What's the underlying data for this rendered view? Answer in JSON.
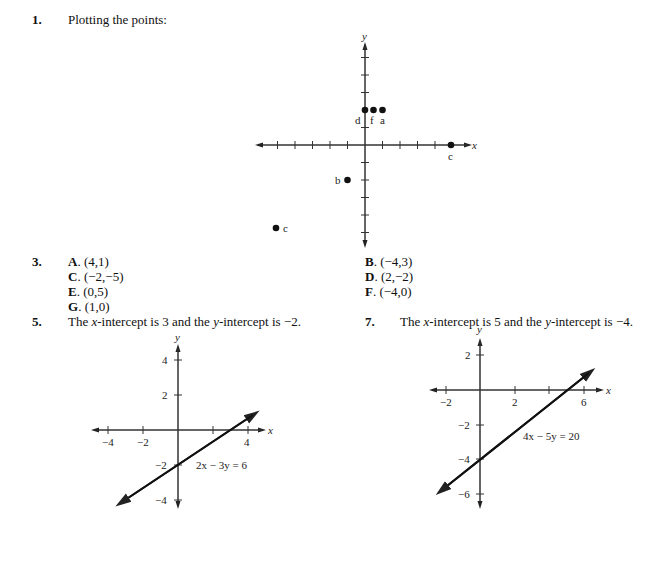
{
  "problem1": {
    "number": "1.",
    "text": "Plotting the points:",
    "graph": {
      "x_axis_label": "x",
      "y_axis_label": "y",
      "points": [
        {
          "label": "d",
          "x": 0,
          "y": 2
        },
        {
          "label": "f",
          "x": 0.5,
          "y": 2
        },
        {
          "label": "a",
          "x": 1,
          "y": 2
        },
        {
          "label": "c",
          "x": 5,
          "y": 0
        },
        {
          "label": "b",
          "x": -1,
          "y": -2
        },
        {
          "label": "e",
          "x": -5,
          "y": -5
        }
      ]
    }
  },
  "problem3": {
    "number": "3.",
    "answers": [
      {
        "letter": "A",
        "value": "(4,1)"
      },
      {
        "letter": "B",
        "value": "(−4,3)"
      },
      {
        "letter": "C",
        "value": "(−2,−5)"
      },
      {
        "letter": "D",
        "value": "(2,−2)"
      },
      {
        "letter": "E",
        "value": "(0,5)"
      },
      {
        "letter": "F",
        "value": "(−4,0)"
      },
      {
        "letter": "G",
        "value": "(1,0)"
      }
    ]
  },
  "problem5": {
    "number": "5.",
    "text_pre": "The ",
    "text_x": "x",
    "text_mid": "-intercept is 3 and the ",
    "text_y": "y",
    "text_post": "-intercept is −2.",
    "graph": {
      "equation": "2x − 3y = 6",
      "x_axis_label": "x",
      "y_axis_label": "y",
      "x_ticks": [
        "−4",
        "−2",
        "4"
      ],
      "y_ticks": [
        "4",
        "2",
        "−2",
        "−4"
      ]
    }
  },
  "problem7": {
    "number": "7.",
    "text_pre": "The ",
    "text_x": "x",
    "text_mid": "-intercept is 5 and the ",
    "text_y": "y",
    "text_post": "-intercept is −4.",
    "graph": {
      "equation": "4x − 5y = 20",
      "x_axis_label": "x",
      "y_axis_label": "y",
      "x_ticks": [
        "−2",
        "2",
        "6"
      ],
      "y_ticks": [
        "2",
        "−2",
        "−4",
        "−6"
      ]
    }
  }
}
